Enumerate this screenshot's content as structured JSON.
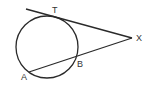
{
  "diagram": {
    "type": "circle-tangent-secant",
    "stroke_color": "#2a2a2a",
    "label_color": "#333333",
    "circle": {
      "cx": 47,
      "cy": 47,
      "r": 31
    },
    "points": {
      "T": {
        "label": "T",
        "x": 55,
        "y": 16
      },
      "X": {
        "label": "X",
        "x": 132,
        "y": 38
      },
      "A": {
        "label": "A",
        "x": 29,
        "y": 72
      },
      "B": {
        "label": "B",
        "x": 77,
        "y": 57
      }
    },
    "segments": [
      {
        "name": "tangent-line-XT",
        "from": "X",
        "to": "T"
      },
      {
        "name": "secant-line-XA",
        "from": "X",
        "to": "A"
      }
    ]
  }
}
